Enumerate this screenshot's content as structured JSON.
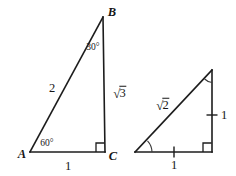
{
  "figure": {
    "background_color": "#ffffff",
    "line_color": "#1c1c1c",
    "width": 236,
    "height": 176
  },
  "triangle_left": {
    "name": "30-60-90 triangle ABC",
    "vertices": {
      "A": {
        "label": "A",
        "x": 30,
        "y": 152
      },
      "B": {
        "label": "B",
        "x": 103,
        "y": 17
      },
      "C": {
        "label": "C",
        "x": 105,
        "y": 152
      }
    },
    "vertex_label_positions": {
      "A": {
        "x": 22,
        "y": 154
      },
      "B": {
        "x": 112,
        "y": 12
      },
      "C": {
        "x": 113,
        "y": 156
      }
    },
    "sides": [
      {
        "name": "hypotenuse-AB",
        "label": "2",
        "x": 52,
        "y": 88
      },
      {
        "name": "leg-BC",
        "label": "√3",
        "radical": true,
        "radicand": "3",
        "x": 120,
        "y": 93
      },
      {
        "name": "leg-AC",
        "label": "1",
        "x": 68,
        "y": 166
      }
    ],
    "angles": [
      {
        "name": "angle-at-B",
        "label": "30°",
        "x": 93,
        "y": 48
      },
      {
        "name": "angle-at-A",
        "label": "60°",
        "x": 47,
        "y": 144
      },
      {
        "name": "angle-at-C",
        "label": "right-angle",
        "marker": "square"
      }
    ]
  },
  "triangle_right": {
    "name": "45-45-90 triangle",
    "vertices": {
      "left": {
        "x": 135,
        "y": 152
      },
      "apex": {
        "x": 212,
        "y": 70
      },
      "corner": {
        "x": 212,
        "y": 152
      }
    },
    "sides": [
      {
        "name": "hypotenuse",
        "label": "√2",
        "radical": true,
        "radicand": "2",
        "x": 163,
        "y": 105
      },
      {
        "name": "vertical-leg",
        "label": "1",
        "x": 224,
        "y": 115,
        "tick": true
      },
      {
        "name": "horizontal-leg",
        "label": "1",
        "x": 174,
        "y": 165,
        "tick": true
      }
    ],
    "angles": [
      {
        "name": "angle-at-apex",
        "marker": "arc"
      },
      {
        "name": "angle-at-left",
        "marker": "arc"
      },
      {
        "name": "angle-at-corner",
        "marker": "square"
      }
    ]
  }
}
